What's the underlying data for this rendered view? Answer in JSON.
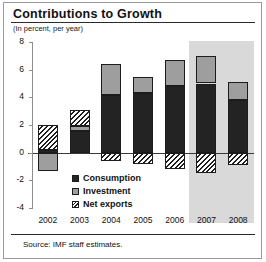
{
  "chart_data": {
    "type": "bar",
    "stacked": true,
    "title": "Contributions to Growth",
    "subtitle": "(In percent, per year)",
    "xlabel": "",
    "ylabel": "",
    "categories": [
      "2002",
      "2003",
      "2004",
      "2005",
      "2006",
      "2007",
      "2008"
    ],
    "series": [
      {
        "name": "Consumption",
        "color": "#232323",
        "values": [
          0.2,
          1.6,
          4.2,
          4.3,
          4.8,
          5.0,
          3.8
        ]
      },
      {
        "name": "Investment",
        "color": "#9e9e9e",
        "values": [
          -1.3,
          0.3,
          2.2,
          1.2,
          1.9,
          2.0,
          1.3
        ]
      },
      {
        "name": "Net exports",
        "color": "hatched",
        "values": [
          1.8,
          1.2,
          -0.6,
          -0.8,
          -1.2,
          -1.5,
          -0.9
        ]
      }
    ],
    "totals": [
      0.7,
      3.1,
      5.8,
      4.7,
      5.5,
      5.5,
      4.2
    ],
    "yticks": [
      8,
      6,
      4,
      2,
      0,
      -2,
      -4
    ],
    "ylim": [
      -4,
      8
    ],
    "grid": false,
    "legend_position": "inside-bottom-left",
    "shaded_region": {
      "label": "forecast",
      "categories": [
        "2007",
        "2008"
      ],
      "color": "#d9d9d9"
    },
    "source": "Source: IMF staff estimates."
  },
  "legend": {
    "items": [
      {
        "label": "Consumption"
      },
      {
        "label": "Investment"
      },
      {
        "label": "Net exports"
      }
    ]
  }
}
